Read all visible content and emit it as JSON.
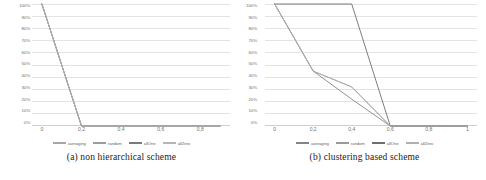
{
  "figure": {
    "panels": [
      {
        "id": "panel-a",
        "caption": "(a) non hierarchical scheme",
        "chart_data": {
          "type": "line",
          "title": "",
          "xlabel": "",
          "ylabel": "",
          "xlim": [
            -0.05,
            0.95
          ],
          "ylim": [
            0,
            100
          ],
          "grid": true,
          "legend_position": "bottom",
          "yticks": [
            "100%",
            "90%",
            "80%",
            "70%",
            "60%",
            "50%",
            "40%",
            "30%",
            "20%",
            "10%",
            "0%"
          ],
          "ytick_values": [
            100,
            90,
            80,
            70,
            60,
            50,
            40,
            30,
            20,
            10,
            0
          ],
          "xticks": [
            "0",
            "0,2",
            "0,4",
            "0,6",
            "0,8"
          ],
          "xtick_values": [
            0,
            0.2,
            0.4,
            0.6,
            0.8
          ],
          "series": [
            {
              "name": "averaging",
              "color": "#a6a6a6",
              "x": [
                0,
                0.2,
                0.4,
                0.6,
                0.8,
                0.9
              ],
              "values": [
                100,
                0,
                0,
                0,
                0,
                0
              ]
            },
            {
              "name": "random",
              "color": "#9c9c9c",
              "x": [
                0,
                0.2,
                0.4,
                0.6,
                0.8,
                0.9
              ],
              "values": [
                100,
                0,
                0,
                0,
                0,
                0
              ]
            },
            {
              "name": "allOne",
              "color": "#7a7a7a",
              "x": [
                0,
                0.2,
                0.4,
                0.6,
                0.8,
                0.9
              ],
              "values": [
                100,
                0,
                0,
                0,
                0,
                0
              ]
            },
            {
              "name": "allZero",
              "color": "#b5b5b5",
              "x": [
                0,
                0.2,
                0.4,
                0.6,
                0.8,
                0.9
              ],
              "values": [
                100,
                0,
                0,
                0,
                0,
                0
              ]
            }
          ]
        }
      },
      {
        "id": "panel-b",
        "caption": "(b) clustering based scheme",
        "chart_data": {
          "type": "line",
          "title": "",
          "xlabel": "",
          "ylabel": "",
          "xlim": [
            -0.05,
            1.05
          ],
          "ylim": [
            0,
            100
          ],
          "grid": true,
          "legend_position": "bottom",
          "yticks": [
            "100%",
            "90%",
            "80%",
            "70%",
            "60%",
            "50%",
            "40%",
            "30%",
            "20%",
            "10%",
            "0%"
          ],
          "ytick_values": [
            100,
            90,
            80,
            70,
            60,
            50,
            40,
            30,
            20,
            10,
            0
          ],
          "xticks": [
            "0",
            "0,2",
            "0,4",
            "0,6",
            "0,8",
            "1"
          ],
          "xtick_values": [
            0,
            0.2,
            0.4,
            0.6,
            0.8,
            1
          ],
          "series": [
            {
              "name": "averaging",
              "color": "#848484",
              "x": [
                0,
                0.2,
                0.4,
                0.6,
                0.8,
                1
              ],
              "values": [
                100,
                45,
                22,
                0,
                0,
                0
              ]
            },
            {
              "name": "random",
              "color": "#9a9a9a",
              "x": [
                0,
                0.2,
                0.4,
                0.6,
                0.8,
                1
              ],
              "values": [
                100,
                45,
                32,
                0,
                0,
                0
              ]
            },
            {
              "name": "allOne",
              "color": "#6e6e6e",
              "x": [
                0,
                0.2,
                0.4,
                0.6,
                0.8,
                1
              ],
              "values": [
                100,
                100,
                100,
                0,
                0,
                0
              ]
            },
            {
              "name": "allZero",
              "color": "#b0b0b0",
              "x": [
                0,
                0.2,
                0.4,
                0.6,
                0.8,
                1
              ],
              "values": [
                100,
                45,
                32,
                0,
                0,
                0
              ]
            }
          ]
        }
      }
    ]
  }
}
